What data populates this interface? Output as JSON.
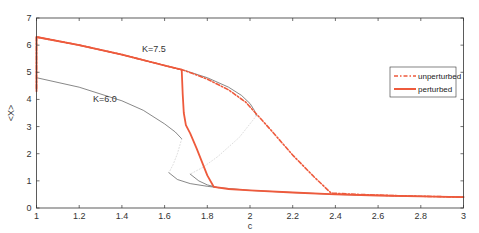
{
  "chart_data": {
    "type": "line",
    "title": "",
    "xlabel": "c",
    "ylabel": "<X>",
    "xlim": [
      1,
      3
    ],
    "ylim": [
      0,
      7
    ],
    "xticks": [
      1,
      1.2,
      1.4,
      1.6,
      1.8,
      2,
      2.2,
      2.4,
      2.6,
      2.8,
      3
    ],
    "xtick_labels": [
      "1",
      "1.2",
      "1.4",
      "1.6",
      "1.8",
      "2",
      "2.2",
      "2.4",
      "2.6",
      "2.8",
      "3"
    ],
    "yticks": [
      0,
      1,
      2,
      3,
      4,
      5,
      6,
      7
    ],
    "ytick_labels": [
      "0",
      "1",
      "2",
      "3",
      "4",
      "5",
      "6",
      "7"
    ],
    "grid": false,
    "legend_position": "right-middle",
    "annotations": [
      {
        "text": "K=7.5",
        "x": 1.55,
        "y": 5.75
      },
      {
        "text": "K=6.0",
        "x": 1.32,
        "y": 3.9
      }
    ],
    "series": [
      {
        "name": "K=7.5 stable upper (thin)",
        "style": "thin-gray",
        "x": [
          1.0,
          1.2,
          1.4,
          1.6,
          1.7,
          1.8,
          1.9,
          1.96,
          2.0,
          2.02,
          2.03
        ],
        "y": [
          6.3,
          6.0,
          5.65,
          5.25,
          5.05,
          4.8,
          4.45,
          4.15,
          3.85,
          3.6,
          3.4
        ]
      },
      {
        "name": "K=7.5 unstable middle (dotted)",
        "style": "dotted-light",
        "x": [
          2.03,
          1.95,
          1.85,
          1.78,
          1.72
        ],
        "y": [
          3.4,
          2.6,
          1.9,
          1.5,
          1.25
        ]
      },
      {
        "name": "K=6.0 stable upper (thin)",
        "style": "thin-gray",
        "x": [
          1.0,
          1.2,
          1.4,
          1.5,
          1.6,
          1.65,
          1.68
        ],
        "y": [
          4.8,
          4.45,
          3.95,
          3.6,
          3.1,
          2.8,
          2.55
        ]
      },
      {
        "name": "K=6.0 unstable middle (dotted)",
        "style": "dotted-light",
        "x": [
          1.68,
          1.66,
          1.64,
          1.62
        ],
        "y": [
          2.55,
          2.0,
          1.6,
          1.3
        ]
      },
      {
        "name": "lower branch K=6.0 (thin)",
        "style": "thin-gray",
        "x": [
          1.62,
          1.66,
          1.72,
          1.8,
          1.85
        ],
        "y": [
          1.3,
          1.05,
          0.9,
          0.8,
          0.75
        ]
      },
      {
        "name": "lower branch K=7.5 (thin)",
        "style": "thin-gray",
        "x": [
          1.72,
          1.76,
          1.8,
          1.85
        ],
        "y": [
          1.25,
          1.0,
          0.85,
          0.75
        ]
      },
      {
        "name": "lower common branch (thin)",
        "style": "thin-gray",
        "x": [
          1.85,
          2.0,
          2.2,
          2.4,
          2.6,
          2.8,
          3.0
        ],
        "y": [
          0.75,
          0.65,
          0.57,
          0.5,
          0.46,
          0.43,
          0.4
        ]
      },
      {
        "name": "unperturbed",
        "style": "dash-dot-red",
        "x": [
          1.0,
          1.0,
          1.2,
          1.4,
          1.6,
          1.7,
          1.8,
          1.9,
          1.98,
          2.1,
          2.2,
          2.3,
          2.38,
          2.5,
          2.7,
          3.0
        ],
        "y": [
          4.4,
          6.3,
          6.0,
          5.65,
          5.25,
          5.05,
          4.75,
          4.35,
          3.9,
          2.85,
          1.95,
          1.15,
          0.55,
          0.5,
          0.45,
          0.4
        ]
      },
      {
        "name": "perturbed",
        "style": "solid-red",
        "x": [
          1.0,
          1.0,
          1.2,
          1.4,
          1.6,
          1.68,
          1.685,
          1.69,
          1.7,
          1.72,
          1.75,
          1.8,
          1.83,
          1.9,
          2.0,
          2.2,
          2.4,
          2.6,
          2.8,
          3.0
        ],
        "y": [
          4.3,
          6.3,
          6.0,
          5.65,
          5.25,
          5.1,
          4.2,
          3.5,
          3.05,
          2.75,
          2.2,
          1.2,
          0.78,
          0.7,
          0.65,
          0.57,
          0.5,
          0.46,
          0.43,
          0.4
        ]
      }
    ],
    "legend": [
      {
        "label": "unperturbed",
        "style": "dash-dot-red"
      },
      {
        "label": "perturbed",
        "style": "solid-red"
      }
    ],
    "colors": {
      "red": "#ee5a3c",
      "gray": "#555555",
      "dotted": "#cfcfcf",
      "axis": "#333333"
    }
  }
}
